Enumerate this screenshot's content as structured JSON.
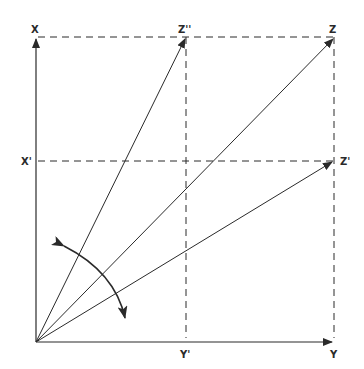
{
  "diagram": {
    "type": "vector-projection",
    "colors": {
      "line": "#2a2a2a",
      "background": "#ffffff"
    },
    "labels": {
      "x": "X",
      "x_prime": "X'",
      "y": "Y",
      "y_prime": "Y'",
      "z": "Z",
      "z_prime": "Z'",
      "z_double_prime": "Z''"
    },
    "points": {
      "origin": [
        36,
        342
      ],
      "x": [
        36,
        37
      ],
      "y": [
        334,
        342
      ],
      "z": [
        334,
        37
      ],
      "z_prime": [
        334,
        161
      ],
      "z_double_prime": [
        186,
        37
      ],
      "x_prime": [
        36,
        161
      ],
      "y_prime": [
        186,
        342
      ]
    },
    "rotation_arrow": {
      "description": "double-headed curved arrow indicating rotation between Z' and Z''"
    }
  }
}
